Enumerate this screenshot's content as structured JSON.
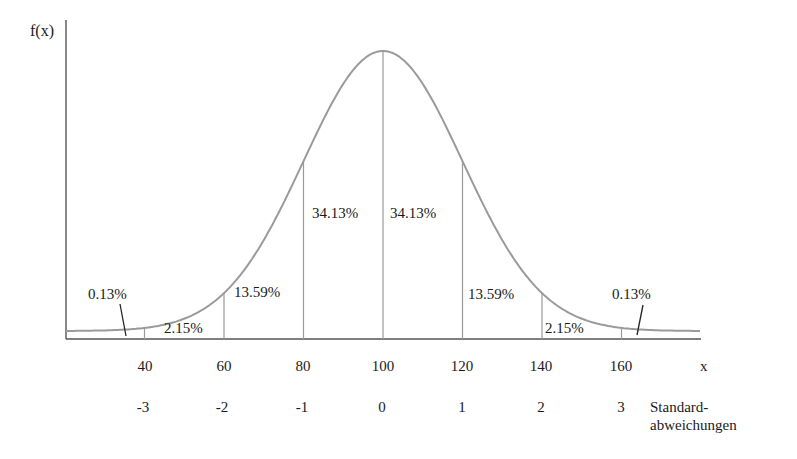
{
  "chart_data": {
    "type": "area",
    "title": "",
    "ylabel": "f(x)",
    "xlabel": "x",
    "distribution": "normal",
    "mean": 100,
    "std_dev": 20,
    "x_ticks": [
      "40",
      "60",
      "80",
      "100",
      "120",
      "140",
      "160"
    ],
    "sd_label": "Standard-\nabweichungen",
    "sd_label_line1": "Standard-",
    "sd_label_line2": "abweichungen",
    "sd_ticks": [
      "-3",
      "-2",
      "-1",
      "0",
      "1",
      "2",
      "3"
    ],
    "regions": [
      {
        "from": "-inf",
        "to": 40,
        "percent": "0.13%"
      },
      {
        "from": 40,
        "to": 60,
        "percent": "2.15%"
      },
      {
        "from": 60,
        "to": 80,
        "percent": "13.59%"
      },
      {
        "from": 80,
        "to": 100,
        "percent": "34.13%"
      },
      {
        "from": 100,
        "to": 120,
        "percent": "34.13%"
      },
      {
        "from": 120,
        "to": 140,
        "percent": "13.59%"
      },
      {
        "from": 140,
        "to": 160,
        "percent": "2.15%"
      },
      {
        "from": 160,
        "to": "inf",
        "percent": "0.13%"
      }
    ],
    "grid": false,
    "legend": null
  },
  "colors": {
    "curve": "#9a9a9a",
    "axis": "#555555",
    "dividers": "#9a9a9a",
    "text": "#1a1a1a"
  }
}
